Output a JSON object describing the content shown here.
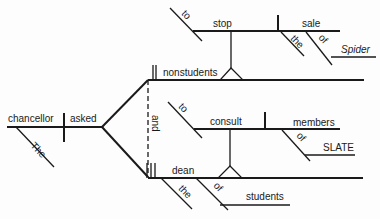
{
  "diagram": {
    "type": "sentence-diagram",
    "subject": {
      "word": "chancellor",
      "modifiers": [
        "The"
      ]
    },
    "verb": "asked",
    "conjunction": "and",
    "objects": [
      {
        "word": "nonstudents",
        "complement": {
          "infinitive_marker": "to",
          "verb": "stop",
          "object": "sale",
          "object_modifiers": [
            "the"
          ],
          "preposition": "of",
          "prep_object": "Spider"
        }
      },
      {
        "word": "dean",
        "modifiers": [
          "the"
        ],
        "preposition": "of",
        "prep_object": "students",
        "complement": {
          "infinitive_marker": "to",
          "verb": "consult",
          "object": "members",
          "preposition": "of",
          "prep_object": "SLATE"
        }
      }
    ]
  },
  "labels": {
    "chancellor": "chancellor",
    "the_subject": "The",
    "asked": "asked",
    "and": "and",
    "nonstudents": "nonstudents",
    "to_1": "to",
    "stop": "stop",
    "sale": "sale",
    "the_sale": "the",
    "of_sale": "of",
    "spider": "Spider",
    "dean": "dean",
    "the_dean": "the",
    "of_dean": "of",
    "students": "students",
    "to_2": "to",
    "consult": "consult",
    "members": "members",
    "of_members": "of",
    "slate": "SLATE"
  }
}
